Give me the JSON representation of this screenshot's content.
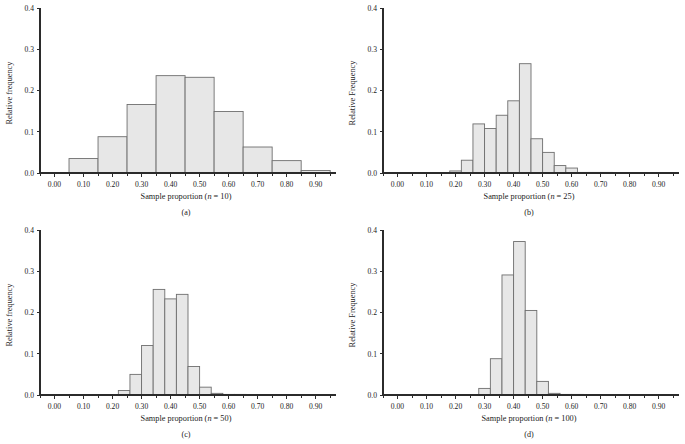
{
  "figure": {
    "type": "multi-panel-histogram-figure",
    "panel_count": 4,
    "background_color": "#ffffff",
    "bar_fill_color": "#e7e7e7",
    "bar_edge_color": "#6e6e6e",
    "axis_color": "#2b2b2b"
  },
  "panels": [
    {
      "key": "a",
      "letter": "(a)",
      "xlabel_prefix": "Sample proportion (",
      "xlabel_italic": "n",
      "xlabel_suffix": " = 10)",
      "ylabel": "Relative frequency",
      "n": 10
    },
    {
      "key": "b",
      "letter": "(b)",
      "xlabel_prefix": "Sample proportion (",
      "xlabel_italic": "n",
      "xlabel_suffix": " = 25)",
      "ylabel": "Relative Frequency",
      "n": 25
    },
    {
      "key": "c",
      "letter": "(c)",
      "xlabel_prefix": "Sample proportion (",
      "xlabel_italic": "n",
      "xlabel_suffix": " = 50)",
      "ylabel": "Relative frequency",
      "n": 50
    },
    {
      "key": "d",
      "letter": "(d)",
      "xlabel_prefix": "Sample proportion (",
      "xlabel_italic": "n",
      "xlabel_suffix": " = 100)",
      "ylabel": "Relative Frequency",
      "n": 100
    }
  ],
  "chart_data": [
    {
      "id": "panel-a",
      "type": "bar",
      "title": "",
      "xlabel": "Sample proportion (n = 10)",
      "ylabel": "Relative frequency",
      "panel_label": "(a)",
      "grid": false,
      "legend": false,
      "xlim": [
        -0.05,
        0.97
      ],
      "ylim": [
        0.0,
        0.4
      ],
      "xticks": [
        0.0,
        0.1,
        0.2,
        0.3,
        0.4,
        0.5,
        0.6,
        0.7,
        0.8,
        0.9
      ],
      "xticklabels": [
        "0.00",
        "0.10",
        "0.20",
        "0.30",
        "0.40",
        "0.50",
        "0.60",
        "0.70",
        "0.80",
        "0.90"
      ],
      "yticks": [
        0.0,
        0.1,
        0.2,
        0.3,
        0.4
      ],
      "yticklabels": [
        "0.0",
        "0.1",
        "0.2",
        "0.3",
        "0.4"
      ],
      "bin_width": 0.1,
      "bin_edges": [
        0.05,
        0.15,
        0.25,
        0.35,
        0.45,
        0.55,
        0.65,
        0.75,
        0.85,
        0.95
      ],
      "bin_centers": [
        0.1,
        0.2,
        0.3,
        0.4,
        0.5,
        0.6,
        0.7,
        0.8,
        0.9
      ],
      "values": [
        0.035,
        0.088,
        0.166,
        0.236,
        0.232,
        0.149,
        0.063,
        0.03,
        0.006
      ]
    },
    {
      "id": "panel-b",
      "type": "bar",
      "title": "",
      "xlabel": "Sample proportion (n = 25)",
      "ylabel": "Relative Frequency",
      "panel_label": "(b)",
      "grid": false,
      "legend": false,
      "xlim": [
        -0.05,
        0.97
      ],
      "ylim": [
        0.0,
        0.4
      ],
      "xticks": [
        0.0,
        0.1,
        0.2,
        0.3,
        0.4,
        0.5,
        0.6,
        0.7,
        0.8,
        0.9
      ],
      "xticklabels": [
        "0.00",
        "0.10",
        "0.20",
        "0.30",
        "0.40",
        "0.50",
        "0.60",
        "0.70",
        "0.80",
        "0.90"
      ],
      "yticks": [
        0.0,
        0.1,
        0.2,
        0.3,
        0.4
      ],
      "yticklabels": [
        "0.0",
        "0.1",
        "0.2",
        "0.3",
        "0.4"
      ],
      "bin_width": 0.04,
      "bin_edges": [
        0.18,
        0.22,
        0.26,
        0.3,
        0.34,
        0.38,
        0.42,
        0.46,
        0.5,
        0.54,
        0.58,
        0.62,
        0.66,
        0.7,
        0.74
      ],
      "bin_centers": [
        0.2,
        0.24,
        0.28,
        0.32,
        0.36,
        0.4,
        0.44,
        0.48,
        0.52,
        0.56,
        0.6,
        0.64,
        0.68,
        0.72
      ],
      "values": [
        0.005,
        0.031,
        0.119,
        0.108,
        0.14,
        0.175,
        0.265,
        0.083,
        0.05,
        0.018,
        0.012,
        0.0,
        0.0,
        0.0
      ]
    },
    {
      "id": "panel-c",
      "type": "bar",
      "title": "",
      "xlabel": "Sample proportion (n = 50)",
      "ylabel": "Relative frequency",
      "panel_label": "(c)",
      "grid": false,
      "legend": false,
      "xlim": [
        -0.05,
        0.97
      ],
      "ylim": [
        0.0,
        0.4
      ],
      "xticks": [
        0.0,
        0.1,
        0.2,
        0.3,
        0.4,
        0.5,
        0.6,
        0.7,
        0.8,
        0.9
      ],
      "xticklabels": [
        "0.00",
        "0.10",
        "0.20",
        "0.30",
        "0.40",
        "0.50",
        "0.60",
        "0.70",
        "0.80",
        "0.90"
      ],
      "yticks": [
        0.0,
        0.1,
        0.2,
        0.3,
        0.4
      ],
      "yticklabels": [
        "0.0",
        "0.1",
        "0.2",
        "0.3",
        "0.4"
      ],
      "bin_width": 0.04,
      "bin_edges": [
        0.22,
        0.26,
        0.3,
        0.34,
        0.38,
        0.42,
        0.46,
        0.5,
        0.54,
        0.58,
        0.62,
        0.66
      ],
      "bin_centers": [
        0.24,
        0.28,
        0.32,
        0.36,
        0.4,
        0.44,
        0.48,
        0.52,
        0.56,
        0.6,
        0.64
      ],
      "values": [
        0.011,
        0.05,
        0.12,
        0.256,
        0.233,
        0.244,
        0.069,
        0.019,
        0.004,
        0.0,
        0.0
      ]
    },
    {
      "id": "panel-d",
      "type": "bar",
      "title": "",
      "xlabel": "Sample proportion (n = 100)",
      "ylabel": "Relative Frequency",
      "panel_label": "(d)",
      "grid": false,
      "legend": false,
      "xlim": [
        -0.05,
        0.97
      ],
      "ylim": [
        0.0,
        0.4
      ],
      "xticks": [
        0.0,
        0.1,
        0.2,
        0.3,
        0.4,
        0.5,
        0.6,
        0.7,
        0.8,
        0.9
      ],
      "xticklabels": [
        "0.00",
        "0.10",
        "0.20",
        "0.30",
        "0.40",
        "0.50",
        "0.60",
        "0.70",
        "0.80",
        "0.90"
      ],
      "yticks": [
        0.0,
        0.1,
        0.2,
        0.3,
        0.4
      ],
      "yticklabels": [
        "0.0",
        "0.1",
        "0.2",
        "0.3",
        "0.4"
      ],
      "bin_width": 0.04,
      "bin_edges": [
        0.28,
        0.32,
        0.36,
        0.4,
        0.44,
        0.48,
        0.52,
        0.56,
        0.6,
        0.64
      ],
      "bin_centers": [
        0.3,
        0.34,
        0.38,
        0.42,
        0.46,
        0.5,
        0.54,
        0.58,
        0.62
      ],
      "values": [
        0.016,
        0.088,
        0.291,
        0.372,
        0.205,
        0.033,
        0.004,
        0.0,
        0.0
      ]
    }
  ]
}
